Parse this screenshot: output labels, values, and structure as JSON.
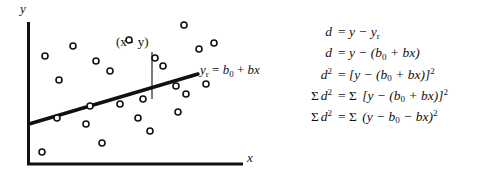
{
  "figure": {
    "axes": {
      "y_label": "y",
      "x_label": "x",
      "origin": [
        28,
        165
      ],
      "y_top": [
        28,
        22
      ],
      "x_right": [
        243,
        165
      ]
    },
    "regression_line": {
      "label_parts": {
        "y": "y",
        "y_sub": "r",
        "eq": "=",
        "b": "b",
        "b_sub": "0",
        "plus": "+",
        "bx": "bx"
      },
      "label_text": "yr = b0 + bx",
      "start": [
        29,
        124
      ],
      "end": [
        198,
        74
      ]
    },
    "point_marker": {
      "label_text": "(x · y)",
      "label_pos": [
        116,
        34
      ],
      "residual_line": {
        "x": 152,
        "y_top": 52,
        "y_bottom": 99
      }
    },
    "scatter_points": [
      [
        73,
        46
      ],
      [
        96,
        61
      ],
      [
        129,
        40
      ],
      [
        184,
        25
      ],
      [
        214,
        43
      ],
      [
        45,
        56
      ],
      [
        59,
        80
      ],
      [
        110,
        71
      ],
      [
        163,
        66
      ],
      [
        199,
        49
      ],
      [
        155,
        58
      ],
      [
        176,
        86
      ],
      [
        90,
        106
      ],
      [
        120,
        104
      ],
      [
        143,
        99
      ],
      [
        186,
        94
      ],
      [
        206,
        84
      ],
      [
        57,
        118
      ],
      [
        86,
        124
      ],
      [
        102,
        143
      ],
      [
        138,
        118
      ],
      [
        150,
        131
      ],
      [
        178,
        112
      ],
      [
        42,
        152
      ]
    ],
    "marker_style": {
      "shape": "open-circle",
      "radius": 3,
      "stroke": "#111111",
      "fill": "#ffffff"
    },
    "line_color": "#111111",
    "axis_color": "#111111"
  },
  "equations": [
    {
      "id": "eq-d-definition",
      "lhs": "d",
      "rhs_html": "= y − y_r",
      "parts": {
        "lhs": "d",
        "rel": "=",
        "rhs": "y − y",
        "rhs_sub": "r"
      }
    },
    {
      "id": "eq-d-expanded",
      "lhs": "d",
      "rhs_html": "= y − (b_0 + bx)",
      "parts": {
        "lhs": "d",
        "rel": "=",
        "rhs": "y − (b",
        "sub": "0",
        "tail": " + bx)"
      }
    },
    {
      "id": "eq-d-squared",
      "lhs": "d²",
      "rhs_html": "= [y − (b_0 + bx)]²",
      "parts": {
        "lhs": "d",
        "lhs_sup": "2",
        "rel": "=",
        "rhs": "[y − (b",
        "sub": "0",
        "tail": " + bx)]",
        "sup": "2"
      }
    },
    {
      "id": "eq-sum-d-squared",
      "lhs": "Σ d²",
      "rhs_html": "= Σ [y − (b_0 + bx)]²",
      "parts": {
        "sigma": "Σ",
        "lhs": "d",
        "lhs_sup": "2",
        "rel": "=",
        "rhs_sigma": "Σ",
        "rhs": "[y − (b",
        "sub": "0",
        "tail": " + bx)]",
        "sup": "2"
      }
    },
    {
      "id": "eq-sum-d-squared-expanded",
      "lhs": "Σ d²",
      "rhs_html": "= Σ (y − b_0 − bx)²",
      "parts": {
        "sigma": "Σ",
        "lhs": "d",
        "lhs_sup": "2",
        "rel": "=",
        "rhs_sigma": "Σ",
        "rhs": "(y − b",
        "sub": "0",
        "tail": " − bx)",
        "sup": "2"
      }
    }
  ],
  "glyphs": {
    "minus": "−",
    "sigma": "Σ",
    "middot": "·",
    "equals": "="
  }
}
